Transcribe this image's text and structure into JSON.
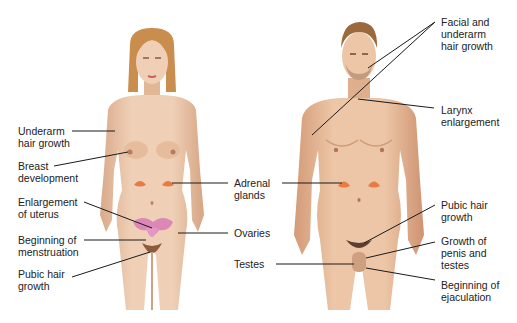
{
  "figure": {
    "colors": {
      "skin": "#e9c4a6",
      "skin_shadow": "#d6a584",
      "female_hair": "#c98d4e",
      "male_hair": "#9a6a3e",
      "adrenal": "#e87a45",
      "uterus_ovaries": "#d97fb6",
      "leader_line": "#1a1a1a",
      "text": "#222222"
    },
    "female": {
      "labels_left": [
        {
          "id": "underarm-hair",
          "text": "Underarm\nhair growth"
        },
        {
          "id": "breast-development",
          "text": "Breast\ndevelopment"
        },
        {
          "id": "uterus-enlargement",
          "text": "Enlargement\nof uterus"
        },
        {
          "id": "menstruation",
          "text": "Beginning of\nmenstruation"
        },
        {
          "id": "pubic-hair",
          "text": "Pubic hair\ngrowth"
        }
      ]
    },
    "shared": {
      "labels_center": [
        {
          "id": "adrenal-glands",
          "text": "Adrenal\nglands"
        },
        {
          "id": "ovaries",
          "text": "Ovaries"
        },
        {
          "id": "testes",
          "text": "Testes"
        }
      ]
    },
    "male": {
      "labels_right": [
        {
          "id": "facial-underarm-hair",
          "text": "Facial and\nunderarm\nhair growth"
        },
        {
          "id": "larynx",
          "text": "Larynx\nenlargement"
        },
        {
          "id": "pubic-hair",
          "text": "Pubic hair\ngrowth"
        },
        {
          "id": "penis-testes",
          "text": "Growth of\npenis and\ntestes"
        },
        {
          "id": "ejaculation",
          "text": "Beginning of\nejaculation"
        }
      ]
    }
  }
}
